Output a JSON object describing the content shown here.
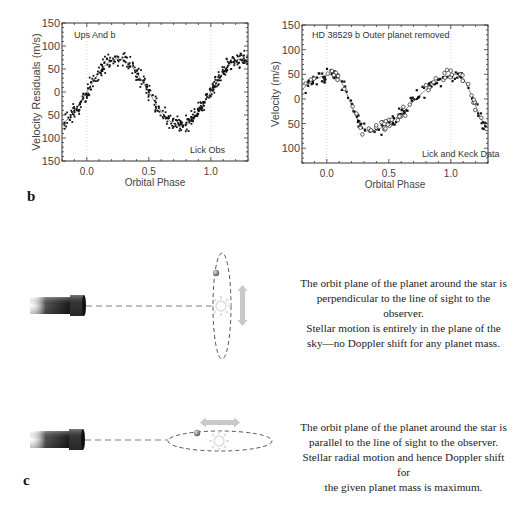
{
  "panel_b": {
    "letter": "b"
  },
  "panel_c": {
    "letter": "c",
    "diagram_top": {
      "caption": "The orbit plane of the planet around the star is perpendicular to the line of sight to the observer. Stellar motion is entirely in the plane of the sky—no Doppler shift for any planet mass.",
      "caption_lines": [
        "The orbit plane of the planet around the star is",
        "perpendicular to the line of sight to the observer.",
        "Stellar motion is entirely in the plane of the",
        "sky—no Doppler shift for any planet mass."
      ],
      "icons": [
        "telescope-icon",
        "star-icon",
        "planet-icon",
        "vertical-motion-arrow-icon"
      ]
    },
    "diagram_bottom": {
      "caption": "The orbit plane of the planet around the star is parallel to the line of sight to the observer. Stellar radial motion and hence Doppler shift for the given planet mass is maximum.",
      "caption_lines": [
        "The orbit plane of the planet around the star is",
        "parallel to the line of sight to the observer.",
        "Stellar radial motion and hence Doppler shift for",
        "the given planet mass is maximum."
      ],
      "icons": [
        "telescope-icon",
        "star-icon",
        "planet-icon",
        "horizontal-motion-arrow-icon"
      ]
    }
  },
  "chart_data": [
    {
      "type": "scatter",
      "title": "Ups And b",
      "annotation": "Lick Obs",
      "xlabel": "Orbital Phase",
      "ylabel": "Velocity Residuals (m/s)",
      "xlim": [
        -0.2,
        1.3
      ],
      "ylim": [
        -150,
        150
      ],
      "xticks": [
        "0.0",
        "0.5",
        "1.0"
      ],
      "yticks": [
        "150",
        "100",
        "50",
        "0",
        "50",
        "100",
        "150"
      ],
      "grid": "vertical dotted lines at phase 0.0 and 1.0",
      "series": [
        {
          "name": "Lick Obs data",
          "marker": "filled dot",
          "model": "sinusoid K≈72 m/s, peak at phase ≈0.25 and ≈1.25, trough at ≈0.75",
          "x": [
            -0.18,
            -0.15,
            -0.1,
            -0.05,
            0.0,
            0.05,
            0.1,
            0.15,
            0.2,
            0.25,
            0.3,
            0.35,
            0.4,
            0.45,
            0.5,
            0.55,
            0.6,
            0.65,
            0.7,
            0.75,
            0.8,
            0.85,
            0.9,
            0.95,
            1.0,
            1.05,
            1.1,
            1.15,
            1.2,
            1.25,
            1.3
          ],
          "y": [
            -65,
            -55,
            -42,
            -25,
            -3,
            20,
            38,
            52,
            66,
            72,
            68,
            55,
            36,
            16,
            -8,
            -30,
            -50,
            -64,
            -70,
            -72,
            -68,
            -55,
            -38,
            -18,
            3,
            25,
            42,
            57,
            68,
            72,
            66
          ]
        },
        {
          "name": "fit",
          "marker": "line"
        }
      ]
    },
    {
      "type": "scatter",
      "title": "HD 38529 b   Outer planet removed",
      "annotation": "Lick and Keck Data",
      "xlabel": "Orbital Phase",
      "ylabel": "Velocity  (m/s)",
      "xlim": [
        -0.2,
        1.3
      ],
      "ylim": [
        -130,
        150
      ],
      "xticks": [
        "0.0",
        "0.5",
        "1.0"
      ],
      "yticks": [
        "150",
        "100",
        "50",
        "0",
        "50",
        "100"
      ],
      "grid": "vertical dotted lines at phase 0.0 and 1.0",
      "series": [
        {
          "name": "Lick",
          "marker": "filled dot",
          "x": [
            -0.18,
            -0.12,
            -0.08,
            -0.03,
            0.02,
            0.06,
            0.1,
            0.15,
            0.2,
            0.25,
            0.3,
            0.33,
            0.36,
            0.4,
            0.45,
            0.5,
            0.55,
            0.6,
            0.65,
            0.7,
            0.75,
            0.8,
            0.85,
            0.9,
            0.95,
            1.0,
            1.04,
            1.08,
            1.12,
            1.16,
            1.2,
            1.25
          ],
          "y": [
            15,
            30,
            42,
            40,
            45,
            48,
            35,
            5,
            -35,
            -55,
            -65,
            -70,
            -65,
            -58,
            -50,
            -42,
            -32,
            -22,
            -10,
            0,
            10,
            22,
            32,
            40,
            42,
            45,
            48,
            38,
            15,
            -10,
            -35,
            -50
          ]
        },
        {
          "name": "Keck",
          "marker": "open circle",
          "x": [
            -0.15,
            -0.1,
            -0.05,
            0.0,
            0.05,
            0.1,
            0.2,
            0.3,
            0.38,
            0.45,
            0.55,
            0.65,
            0.75,
            0.85,
            0.95,
            1.05,
            1.1,
            1.2,
            1.3
          ],
          "y": [
            10,
            40,
            48,
            45,
            50,
            30,
            -25,
            -60,
            -45,
            -48,
            -35,
            -15,
            5,
            30,
            45,
            50,
            30,
            -40,
            -58
          ]
        },
        {
          "name": "fit",
          "marker": "line",
          "model": "eccentric orbit: peak ≈50 m/s near phase 0.05 and 1.05, minimum ≈ -65 m/s near phase 0.33"
        }
      ]
    }
  ]
}
